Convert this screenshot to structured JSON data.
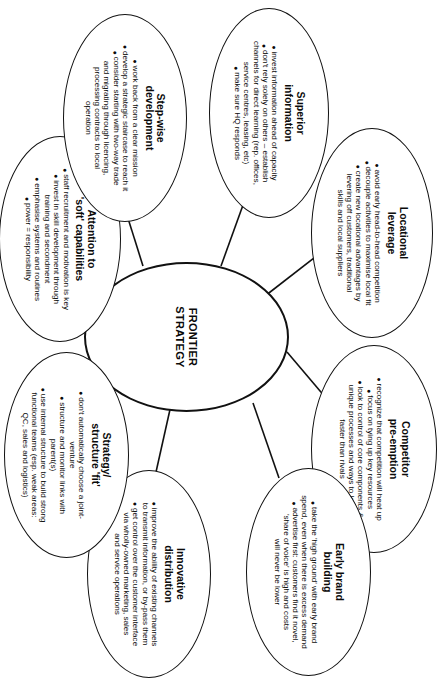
{
  "diagram": {
    "type": "mind-map",
    "orientation": "rotated-90-clockwise",
    "center": {
      "title": "FRONTIER\nSTRATEGY"
    },
    "bullet_glyph": "●",
    "nodes": [
      {
        "id": "locational",
        "title": "Locational\nleverage",
        "bullets": [
          "avoid early head-to-head competition",
          "decouple activities to maximise local fit",
          "create new locational advantages by\nlevering off customers, traditional\nskills and local suppliers"
        ]
      },
      {
        "id": "competitor",
        "title": "Competitor\npre-emption",
        "bullets": [
          "recognize that competition will heat up",
          "focus on tying up key resources",
          "look to control of core components &\nunique processes and ways to learn\nfaster than rivals"
        ]
      },
      {
        "id": "earlybrand",
        "title": "Early brand\nbuilding",
        "bullets": [
          "take the 'high ground' with early brand\nspend, even when there is excess demand",
          "advertise first: customers find it novel,\n'share of voice' is high and costs\nwill never be lower"
        ]
      },
      {
        "id": "innovative",
        "title": "Innovative\ndistribution",
        "bullets": [
          "improve the ability of existing channels\nto transmit information, or by-pass them",
          "get control over the customer interface\nvia wholly-owned marketing, sales\nand service operations"
        ]
      },
      {
        "id": "strategyfit",
        "title": "Strategy/\nstructure 'fit'",
        "bullets": [
          "don't automatically choose a joint-\nventure",
          "structure and monitor links with\nparent(s)",
          "use internal structure to build strong\nfunctional teams (esp. weak areas:\nQC, sales and logistics)"
        ]
      },
      {
        "id": "softcaps",
        "title": "Attention to\n'soft' capabilities",
        "bullets": [
          "staff recruitment and motivation is key",
          "invest in skill development through\ntraining and secondment",
          "emphasise systems and routines",
          "power = responsibility"
        ]
      },
      {
        "id": "stepwise",
        "title": "Step-wise\ndevelopment",
        "bullets": [
          "work back from a clear mission",
          "develop a strategic staircase to reach it",
          "consider starting with two-way trade\nand migrating through licencing,\nprocessing contracts to local\noperation"
        ]
      },
      {
        "id": "superior",
        "title": "Superior\ninformation",
        "bullets": [
          "invest information ahead of capacity",
          "don't rely solely on others – establish\nchannels for direct learning (rep. offices,\nservice centres, leasing, etc)",
          "make sure HQ responds"
        ]
      }
    ]
  }
}
